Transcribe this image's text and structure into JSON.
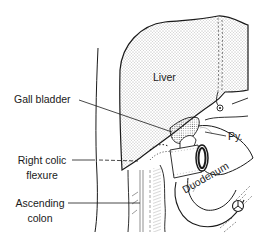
{
  "figure": {
    "type": "anatomical-diagram",
    "labels": {
      "liver": "Liver",
      "gall_bladder": "Gall bladder",
      "pylorus": "Py.",
      "right_colic_flexure_line1": "Right colic",
      "right_colic_flexure_line2": "flexure",
      "ascending_colon_line1": "Ascending",
      "ascending_colon_line2": "colon",
      "duodenum": "Duodenum"
    },
    "colors": {
      "ink": "#1a1a1a",
      "stipple": "#555555",
      "background": "#ffffff"
    }
  }
}
